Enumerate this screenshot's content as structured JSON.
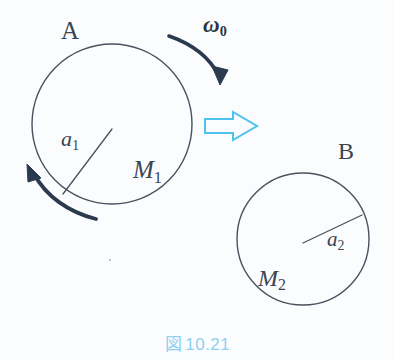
{
  "figure": {
    "caption_marker": "図",
    "caption_number": "10.21",
    "background_color": "#fbfcfe",
    "caption_color": "#8fd0ef",
    "ink_color": "#3c4450",
    "arrow_dark_color": "#2b3a4f",
    "arrow_cyan_color": "#4cc3f0"
  },
  "body_a": {
    "name": "A",
    "radius_label": "a",
    "radius_subscript": "1",
    "mass_label": "M",
    "mass_subscript": "1",
    "center_x": 112,
    "center_y": 124,
    "radius": 80
  },
  "body_b": {
    "name": "B",
    "radius_label": "a",
    "radius_subscript": "2",
    "mass_label": "M",
    "mass_subscript": "2",
    "center_x": 303,
    "center_y": 239,
    "radius": 66
  },
  "angular_velocity": {
    "symbol": "ω",
    "subscript": "0"
  }
}
